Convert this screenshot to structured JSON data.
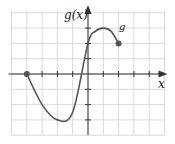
{
  "chart_data": {
    "type": "line",
    "title": "",
    "xlabel": "x",
    "ylabel": "g(x)",
    "function_label": "g",
    "grid": true,
    "xlim": [
      -5,
      5
    ],
    "ylim": [
      -4,
      4
    ],
    "tick_step": 1,
    "tick_labels_shown": false,
    "series": [
      {
        "name": "g",
        "x": [
          -4,
          -3,
          -2,
          -1,
          0,
          0.5,
          1,
          1.5,
          2
        ],
        "values": [
          0,
          -2,
          -3,
          -2.5,
          2,
          2.8,
          3,
          2.8,
          2
        ],
        "endpoints": [
          {
            "x": -4,
            "y": 0,
            "closed": true
          },
          {
            "x": 2,
            "y": 2,
            "closed": true
          }
        ]
      }
    ]
  },
  "labels": {
    "y_axis": "g(x)",
    "x_axis": "x",
    "curve": "g"
  },
  "colors": {
    "curve": "#555555",
    "axis": "#333333",
    "grid": "#d9d9d9"
  }
}
